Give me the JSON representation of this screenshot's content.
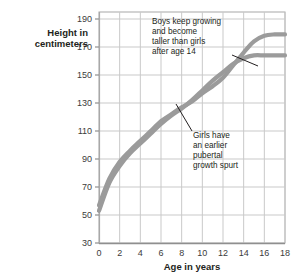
{
  "chart_data": {
    "type": "line",
    "title": "",
    "xlabel": "Age in years",
    "ylabel": "Height in centimeters",
    "ylabel_line1": "Height in",
    "ylabel_line2": "centimeters",
    "xlim": [
      0,
      18
    ],
    "ylim": [
      30,
      195
    ],
    "grid": true,
    "legend": "none",
    "xticks": [
      "0",
      "2",
      "4",
      "6",
      "8",
      "10",
      "12",
      "14",
      "16",
      "18"
    ],
    "xtick_values": [
      0,
      2,
      4,
      6,
      8,
      10,
      12,
      14,
      16,
      18
    ],
    "yticks": [
      "30",
      "50",
      "70",
      "90",
      "110",
      "130",
      "150",
      "170",
      "190"
    ],
    "ytick_values": [
      30,
      50,
      70,
      90,
      110,
      130,
      150,
      170,
      190
    ],
    "x": [
      0,
      1,
      2,
      3,
      4,
      5,
      6,
      7,
      8,
      9,
      10,
      11,
      12,
      13,
      14,
      15,
      16,
      17,
      18
    ],
    "series": [
      {
        "name": "Boys",
        "color": "#9b9b9b",
        "values": [
          57,
          76,
          88,
          96,
          103,
          110,
          117,
          122,
          127,
          131,
          137,
          142,
          148,
          157,
          166,
          174,
          178,
          179,
          179
        ]
      },
      {
        "name": "Girls",
        "color": "#9b9b9b",
        "values": [
          53,
          73,
          85,
          94,
          101,
          108,
          115,
          121,
          126,
          132,
          139,
          146,
          152,
          158,
          162,
          164,
          164,
          164,
          164
        ]
      }
    ],
    "annotations": [
      {
        "id": "boys-note",
        "lines": [
          "Boys keep growing",
          "and become",
          "taller than girls",
          "after age 14"
        ],
        "text": "Boys keep growing and become taller than girls after age 14",
        "points_to_series": "Boys",
        "points_to_age": 15.5
      },
      {
        "id": "girls-note",
        "lines": [
          "Girls have",
          "an earlier",
          "pubertal",
          "growth spurt"
        ],
        "text": "Girls have an earlier pubertal growth spurt",
        "points_to_series": "Girls",
        "points_to_age": 11
      }
    ],
    "colors": {
      "curve": "#9b9b9b",
      "grid": "#c9c9c9",
      "axis": "#8f8f8f",
      "text": "#231f20",
      "tick_text": "#3b3b3b",
      "background": "#ffffff"
    }
  }
}
